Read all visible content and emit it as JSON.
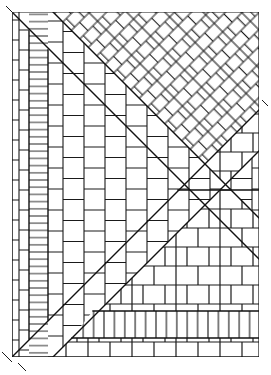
{
  "figure": {
    "kind": "line-drawing",
    "width": 271,
    "height": 375,
    "background_color": "#ffffff",
    "line_color": "#1a1a1a",
    "divider_color": "#111111",
    "line_width": 1,
    "divider_width": 1.4,
    "frame": {
      "left": 12,
      "top": 12,
      "right": 259,
      "bottom": 357
    }
  },
  "dividers": [
    {
      "name": "upper-left-diagonal",
      "note": "runs from top-left corner down to the right edge",
      "x1": 12,
      "y1": 12,
      "x2": 259,
      "y2": 259
    },
    {
      "name": "lower-left-diagonal",
      "note": "runs from bottom-left corner up to the right edge",
      "x1": 12,
      "y1": 357,
      "x2": 259,
      "y2": 110
    },
    {
      "name": "second-upper-diagonal",
      "note": "parallel band edge in the upper-left area",
      "x1": 53,
      "y1": 12,
      "x2": 259,
      "y2": 218
    },
    {
      "name": "second-lower-diagonal",
      "note": "parallel band edge in the lower-left area",
      "x1": 53,
      "y1": 357,
      "x2": 259,
      "y2": 151
    },
    {
      "name": "right-horizontal-divider",
      "note": "horizontal rule splitting the right side at mid height",
      "x1": 178,
      "y1": 190,
      "x2": 259,
      "y2": 190
    },
    {
      "name": "bottom-soldier-band-top",
      "x1": 93,
      "y1": 311,
      "x2": 259,
      "y2": 311
    },
    {
      "name": "bottom-soldier-band-bottom",
      "x1": 72,
      "y1": 338,
      "x2": 259,
      "y2": 338
    },
    {
      "name": "left-column-divider-1",
      "x1": 29,
      "y1": 31,
      "x2": 29,
      "y2": 339
    },
    {
      "name": "left-column-divider-2",
      "x1": 48,
      "y1": 50,
      "x2": 48,
      "y2": 320
    }
  ],
  "regions": [
    {
      "id": "diagonal-running-bond-large",
      "label": "Diagonal running bond (large units)",
      "location": "upper right",
      "pattern": "diagonal-stretcher-45",
      "brick_length": 27,
      "brick_height": 12,
      "angle_deg": -45
    },
    {
      "id": "diagonal-running-bond-fine",
      "label": "Diagonal running bond (narrow units)",
      "location": "upper-left band",
      "pattern": "diagonal-stretcher-45-fine",
      "brick_length": 22,
      "brick_height": 6,
      "angle_deg": -45
    },
    {
      "id": "diagonal-running-bond-lower",
      "label": "Diagonal running bond (narrow units)",
      "location": "lower-left band",
      "pattern": "diagonal-stretcher-45-fine",
      "brick_length": 22,
      "brick_height": 6,
      "angle_deg": 45
    },
    {
      "id": "vertical-running-bond-wide",
      "label": "Vertical running bond (soldier courses)",
      "location": "centre wedge",
      "pattern": "vertical-stretcher",
      "brick_length": 40,
      "brick_height": 20
    },
    {
      "id": "thin-stack-courses",
      "label": "Thin stacked courses",
      "location": "second left column",
      "pattern": "thin-horizontal-stack",
      "brick_height": 7
    },
    {
      "id": "tall-vertical-bond",
      "label": "Tall vertical running bond",
      "location": "far left column",
      "pattern": "vertical-stretcher-tall",
      "brick_length": 40,
      "brick_height": 19
    },
    {
      "id": "horizontal-running-bond",
      "label": "Horizontal running bond (stretcher bond)",
      "location": "lower right",
      "pattern": "horizontal-stretcher",
      "brick_length": 44,
      "brick_height": 19
    },
    {
      "id": "soldier-course-band",
      "label": "Soldier course band",
      "location": "bottom strip",
      "pattern": "soldier-course",
      "brick_width": 8,
      "brick_height": 27
    },
    {
      "id": "bottom-running-bond",
      "label": "Horizontal running bond",
      "location": "bottom edge strip",
      "pattern": "horizontal-stretcher",
      "brick_length": 44,
      "brick_height": 19
    }
  ]
}
